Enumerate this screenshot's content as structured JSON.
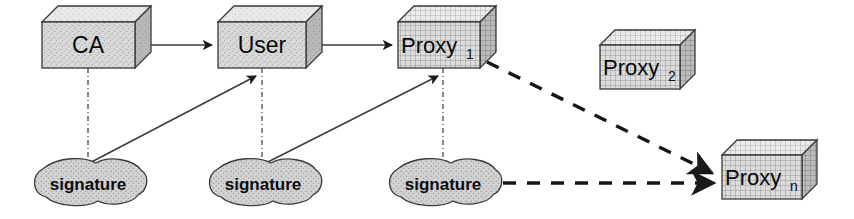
{
  "diagram": {
    "background_color": "#ffffff",
    "stroke_color": "#2b2b2b",
    "box_face_color": "#d8d8d8",
    "box_top_color": "#e8e8e8",
    "box_side_color": "#b5b5b5",
    "cloud_fill_color": "#cfcfcf",
    "nodes": [
      {
        "id": "ca",
        "label": "CA",
        "subscript": "",
        "shape": "cube",
        "texture": "speckle",
        "x": 42,
        "y": 22,
        "w": 93,
        "h": 46,
        "depth": 16
      },
      {
        "id": "user",
        "label": "User",
        "subscript": "",
        "shape": "cube",
        "texture": "speckle",
        "x": 218,
        "y": 22,
        "w": 88,
        "h": 46,
        "depth": 16
      },
      {
        "id": "proxy1",
        "label": "Proxy",
        "subscript": "1",
        "shape": "cube",
        "texture": "grid",
        "x": 398,
        "y": 22,
        "w": 82,
        "h": 46,
        "depth": 16
      },
      {
        "id": "proxy2",
        "label": "Proxy",
        "subscript": "2",
        "shape": "cube",
        "texture": "grid",
        "x": 600,
        "y": 45,
        "w": 80,
        "h": 44,
        "depth": 15
      },
      {
        "id": "proxyn",
        "label": "Proxy",
        "subscript": "n",
        "shape": "cube",
        "texture": "grid",
        "x": 722,
        "y": 155,
        "w": 80,
        "h": 44,
        "depth": 15
      }
    ],
    "clouds": [
      {
        "id": "signature1",
        "label": "signature",
        "cx": 88,
        "cy": 183,
        "rx": 58,
        "ry": 23
      },
      {
        "id": "signature2",
        "label": "signature",
        "cx": 263,
        "cy": 183,
        "rx": 58,
        "ry": 23
      },
      {
        "id": "signature3",
        "label": "signature",
        "cx": 443,
        "cy": 183,
        "rx": 58,
        "ry": 23
      }
    ],
    "edges": [
      {
        "id": "ca-to-user",
        "from": "ca",
        "to": "user",
        "style": "solid",
        "arrow": true
      },
      {
        "id": "user-to-proxy1",
        "from": "user",
        "to": "proxy1",
        "style": "solid",
        "arrow": true
      },
      {
        "id": "ca-to-signature1",
        "from": "ca",
        "to": "signature1",
        "style": "dash-dot",
        "arrow": false
      },
      {
        "id": "user-to-signature2",
        "from": "user",
        "to": "signature2",
        "style": "dash-dot",
        "arrow": false
      },
      {
        "id": "proxy1-to-signature3",
        "from": "proxy1",
        "to": "signature3",
        "style": "dash-dot",
        "arrow": false
      },
      {
        "id": "signature1-to-user",
        "from": "signature1",
        "to": "user",
        "style": "solid",
        "arrow": true
      },
      {
        "id": "signature2-to-proxy1",
        "from": "signature2",
        "to": "proxy1",
        "style": "solid",
        "arrow": true
      },
      {
        "id": "proxy1-to-proxyn",
        "from": "proxy1",
        "to": "proxyn",
        "style": "dashed",
        "arrow": true
      },
      {
        "id": "signature3-to-proxyn",
        "from": "signature3",
        "to": "proxyn",
        "style": "dashed",
        "arrow": true
      }
    ]
  }
}
